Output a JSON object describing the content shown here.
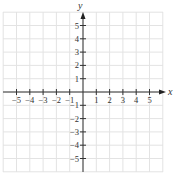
{
  "chart_data": {
    "type": "scatter",
    "title": "",
    "xlabel": "x",
    "ylabel": "y",
    "xlim": [
      -6,
      6
    ],
    "ylim": [
      -6,
      6
    ],
    "grid": true,
    "x_ticks": [
      -5,
      -4,
      -3,
      -2,
      -1,
      1,
      2,
      3,
      4,
      5
    ],
    "y_ticks": [
      -5,
      -4,
      -3,
      -2,
      -1,
      1,
      2,
      3,
      4,
      5
    ],
    "x_tick_labels": [
      "−5",
      "−4",
      "−3",
      "−2",
      "−1",
      "1",
      "2",
      "3",
      "4",
      "5"
    ],
    "y_tick_labels": [
      "−5",
      "−4",
      "−3",
      "−2",
      "−1",
      "1",
      "2",
      "3",
      "4",
      "5"
    ],
    "series": [],
    "legend": null
  },
  "axes": {
    "x_label": "x",
    "y_label": "y"
  },
  "colors": {
    "grid": "#e3e3e3",
    "axis": "#333333",
    "text": "#333333"
  }
}
